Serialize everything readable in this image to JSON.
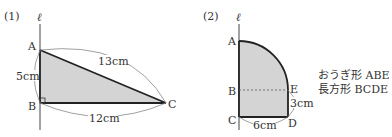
{
  "figure1": {
    "label": "(1)",
    "axis_label": "ℓ",
    "vertices": {
      "A": "A",
      "B": "B",
      "C": "C"
    },
    "measures": {
      "AB": "5cm",
      "AC": "13cm",
      "BC": "12cm"
    }
  },
  "figure2": {
    "label": "(2)",
    "axis_label": "ℓ",
    "vertices": {
      "A": "A",
      "B": "B",
      "C": "C",
      "D": "D",
      "E": "E"
    },
    "measures": {
      "DE": "3cm",
      "CD": "6cm"
    },
    "caption": [
      "おうぎ形 ABE",
      "長方形 BCDE"
    ]
  },
  "colors": {
    "fill": "#d4d4d4",
    "stroke": "#222222",
    "thin": "#888888"
  }
}
